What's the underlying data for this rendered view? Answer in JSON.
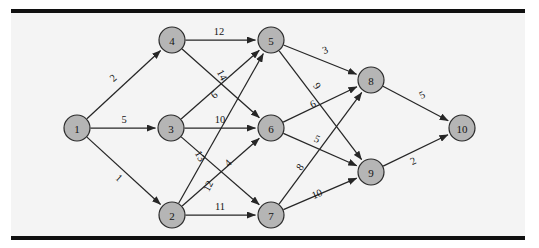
{
  "figure": {
    "background_color": "#f4f4f4",
    "rule_color": "#101010",
    "node_fill": "#b5b5b5",
    "node_stroke": "#2b2b2b",
    "edge_color": "#262626"
  },
  "chart_data": {
    "type": "diagram",
    "diagram_kind": "directed-weighted-graph",
    "title": "",
    "xlabel": "",
    "ylabel": "",
    "directed": true,
    "weighted": true,
    "node_count": 10,
    "edge_count": 19,
    "nodes": [
      {
        "id": "1",
        "label": "1",
        "x": 77,
        "y": 128,
        "r": 13
      },
      {
        "id": "2",
        "label": "2",
        "x": 172,
        "y": 215,
        "r": 13
      },
      {
        "id": "3",
        "label": "3",
        "x": 171,
        "y": 128,
        "r": 13
      },
      {
        "id": "4",
        "label": "4",
        "x": 172,
        "y": 40,
        "r": 13
      },
      {
        "id": "5",
        "label": "5",
        "x": 271,
        "y": 40,
        "r": 13
      },
      {
        "id": "6",
        "label": "6",
        "x": 271,
        "y": 128,
        "r": 13
      },
      {
        "id": "7",
        "label": "7",
        "x": 271,
        "y": 215,
        "r": 13
      },
      {
        "id": "8",
        "label": "8",
        "x": 371,
        "y": 80,
        "r": 13
      },
      {
        "id": "9",
        "label": "9",
        "x": 371,
        "y": 172,
        "r": 13
      },
      {
        "id": "10",
        "label": "10",
        "x": 462,
        "y": 128,
        "r": 13
      }
    ],
    "edges": [
      {
        "from": "1",
        "to": "4",
        "weight": "2",
        "lx": 113,
        "ly": 78,
        "rot": -42
      },
      {
        "from": "1",
        "to": "3",
        "weight": "5",
        "lx": 124,
        "ly": 119,
        "rot": 0
      },
      {
        "from": "1",
        "to": "2",
        "weight": "1",
        "lx": 119,
        "ly": 178,
        "rot": 42
      },
      {
        "from": "4",
        "to": "5",
        "weight": "12",
        "lx": 219,
        "ly": 31,
        "rot": 0
      },
      {
        "from": "4",
        "to": "6",
        "weight": "14",
        "lx": 222,
        "ly": 75,
        "rot": 62
      },
      {
        "from": "3",
        "to": "5",
        "weight": "6",
        "lx": 214,
        "ly": 95,
        "rot": -42
      },
      {
        "from": "3",
        "to": "6",
        "weight": "10",
        "lx": 220,
        "ly": 119,
        "rot": 0
      },
      {
        "from": "3",
        "to": "7",
        "weight": "13",
        "lx": 200,
        "ly": 156,
        "rot": 62
      },
      {
        "from": "2",
        "to": "6",
        "weight": "4",
        "lx": 228,
        "ly": 163,
        "rot": -44
      },
      {
        "from": "2",
        "to": "5",
        "weight": "12",
        "lx": 208,
        "ly": 186,
        "rot": -62
      },
      {
        "from": "2",
        "to": "7",
        "weight": "11",
        "lx": 220,
        "ly": 206,
        "rot": 0
      },
      {
        "from": "5",
        "to": "8",
        "weight": "3",
        "lx": 325,
        "ly": 50,
        "rot": -22
      },
      {
        "from": "5",
        "to": "9",
        "weight": "9",
        "lx": 317,
        "ly": 86,
        "rot": 55
      },
      {
        "from": "6",
        "to": "8",
        "weight": "6",
        "lx": 313,
        "ly": 104,
        "rot": -25
      },
      {
        "from": "6",
        "to": "9",
        "weight": "5",
        "lx": 317,
        "ly": 139,
        "rot": 25
      },
      {
        "from": "7",
        "to": "8",
        "weight": "8",
        "lx": 300,
        "ly": 167,
        "rot": -54
      },
      {
        "from": "7",
        "to": "9",
        "weight": "10",
        "lx": 317,
        "ly": 194,
        "rot": -23
      },
      {
        "from": "8",
        "to": "10",
        "weight": "5",
        "lx": 422,
        "ly": 95,
        "rot": -26
      },
      {
        "from": "9",
        "to": "10",
        "weight": "2",
        "lx": 413,
        "ly": 161,
        "rot": -26
      }
    ]
  }
}
